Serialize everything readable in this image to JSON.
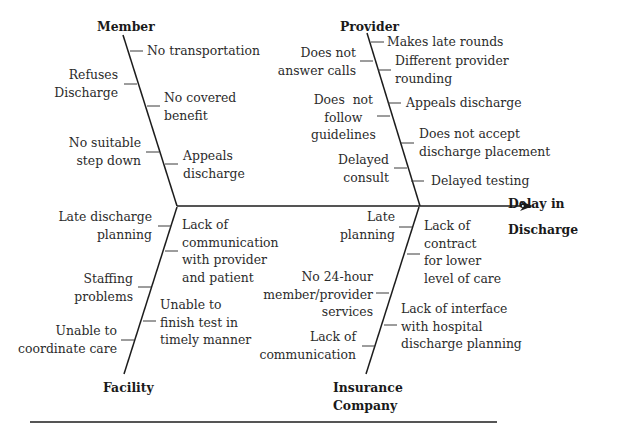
{
  "diagram": {
    "type": "fishbone",
    "effect": "Delay in\nDischarge",
    "colors": {
      "line": "#1c1c1c",
      "text": "#2b2b2b",
      "rule": "#555555"
    },
    "categories": [
      {
        "name": "Member",
        "causes": [
          "No transportation",
          "Refuses\nDischarge",
          "No covered\nbenefit",
          "No suitable\nstep down",
          "Appeals\ndischarge"
        ]
      },
      {
        "name": "Provider",
        "causes": [
          "Makes late rounds",
          "Does not\nanswer calls",
          "Different provider\nrounding",
          "Appeals discharge",
          "Does  not\nfollow\nguidelines",
          "Does not accept\ndischarge placement",
          "Delayed\nconsult",
          "Delayed testing"
        ]
      },
      {
        "name": "Facility",
        "causes": [
          "Late discharge\nplanning",
          "Lack of\ncommunication\nwith provider\nand patient",
          "Staffing\nproblems",
          "Unable to\nfinish test in\ntimely manner",
          "Unable to\ncoordinate care"
        ]
      },
      {
        "name": "Insurance\nCompany",
        "causes": [
          "Late\nplanning",
          "Lack of\ncontract\nfor lower\nlevel of care",
          "No 24-hour\nmember/provider\nservices",
          "Lack of interface\nwith hospital\ndischarge planning",
          "Lack of\ncommunication"
        ]
      }
    ]
  }
}
